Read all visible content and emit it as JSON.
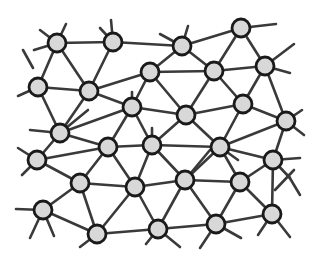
{
  "diagram": {
    "type": "network-graph",
    "colors": {
      "node_fill": "#d8d8d8",
      "node_stroke": "#1a1a1a",
      "edge": "#3a3a3a",
      "background": "#ffffff"
    },
    "node_radius": 9,
    "nodes": [
      {
        "id": 0,
        "x": 57,
        "y": 43
      },
      {
        "id": 1,
        "x": 113,
        "y": 42
      },
      {
        "id": 2,
        "x": 182,
        "y": 46
      },
      {
        "id": 3,
        "x": 241,
        "y": 28
      },
      {
        "id": 4,
        "x": 38,
        "y": 87
      },
      {
        "id": 5,
        "x": 89,
        "y": 91
      },
      {
        "id": 6,
        "x": 150,
        "y": 72
      },
      {
        "id": 7,
        "x": 214,
        "y": 71
      },
      {
        "id": 8,
        "x": 265,
        "y": 66
      },
      {
        "id": 9,
        "x": 60,
        "y": 133
      },
      {
        "id": 10,
        "x": 132,
        "y": 107
      },
      {
        "id": 11,
        "x": 186,
        "y": 115
      },
      {
        "id": 12,
        "x": 243,
        "y": 104
      },
      {
        "id": 13,
        "x": 286,
        "y": 121
      },
      {
        "id": 14,
        "x": 37,
        "y": 160
      },
      {
        "id": 15,
        "x": 108,
        "y": 147
      },
      {
        "id": 16,
        "x": 152,
        "y": 145
      },
      {
        "id": 17,
        "x": 220,
        "y": 147
      },
      {
        "id": 18,
        "x": 273,
        "y": 160
      },
      {
        "id": 19,
        "x": 80,
        "y": 183
      },
      {
        "id": 20,
        "x": 135,
        "y": 187
      },
      {
        "id": 21,
        "x": 185,
        "y": 180
      },
      {
        "id": 22,
        "x": 240,
        "y": 182
      },
      {
        "id": 23,
        "x": 43,
        "y": 210
      },
      {
        "id": 24,
        "x": 97,
        "y": 234
      },
      {
        "id": 25,
        "x": 158,
        "y": 229
      },
      {
        "id": 26,
        "x": 216,
        "y": 224
      },
      {
        "id": 27,
        "x": 272,
        "y": 214
      }
    ],
    "edges": [
      [
        0,
        1
      ],
      [
        0,
        4
      ],
      [
        0,
        5
      ],
      [
        1,
        2
      ],
      [
        1,
        5
      ],
      [
        2,
        3
      ],
      [
        2,
        6
      ],
      [
        2,
        7
      ],
      [
        3,
        7
      ],
      [
        3,
        8
      ],
      [
        4,
        5
      ],
      [
        4,
        9
      ],
      [
        5,
        6
      ],
      [
        5,
        9
      ],
      [
        5,
        10
      ],
      [
        6,
        7
      ],
      [
        6,
        10
      ],
      [
        6,
        11
      ],
      [
        7,
        8
      ],
      [
        7,
        11
      ],
      [
        7,
        12
      ],
      [
        8,
        12
      ],
      [
        8,
        13
      ],
      [
        9,
        10
      ],
      [
        9,
        14
      ],
      [
        9,
        15
      ],
      [
        10,
        11
      ],
      [
        10,
        15
      ],
      [
        10,
        16
      ],
      [
        11,
        12
      ],
      [
        11,
        16
      ],
      [
        11,
        17
      ],
      [
        12,
        13
      ],
      [
        12,
        17
      ],
      [
        13,
        17
      ],
      [
        13,
        18
      ],
      [
        14,
        19
      ],
      [
        14,
        15
      ],
      [
        15,
        16
      ],
      [
        15,
        19
      ],
      [
        15,
        20
      ],
      [
        16,
        17
      ],
      [
        16,
        20
      ],
      [
        16,
        21
      ],
      [
        17,
        21
      ],
      [
        17,
        22
      ],
      [
        17,
        18
      ],
      [
        18,
        22
      ],
      [
        18,
        27
      ],
      [
        19,
        20
      ],
      [
        19,
        23
      ],
      [
        19,
        24
      ],
      [
        20,
        21
      ],
      [
        20,
        24
      ],
      [
        20,
        25
      ],
      [
        21,
        22
      ],
      [
        21,
        25
      ],
      [
        21,
        26
      ],
      [
        22,
        26
      ],
      [
        22,
        27
      ],
      [
        23,
        24
      ],
      [
        24,
        25
      ],
      [
        25,
        26
      ],
      [
        26,
        27
      ]
    ],
    "stubs": [
      [
        57,
        43,
        40,
        30
      ],
      [
        57,
        43,
        66,
        24
      ],
      [
        57,
        43,
        34,
        50
      ],
      [
        113,
        42,
        111,
        20
      ],
      [
        113,
        42,
        100,
        28
      ],
      [
        23,
        50,
        33,
        68
      ],
      [
        38,
        87,
        18,
        96
      ],
      [
        182,
        46,
        160,
        34
      ],
      [
        182,
        46,
        188,
        26
      ],
      [
        241,
        28,
        276,
        24
      ],
      [
        265,
        66,
        294,
        44
      ],
      [
        265,
        66,
        290,
        73
      ],
      [
        286,
        121,
        302,
        110
      ],
      [
        286,
        121,
        304,
        135
      ],
      [
        273,
        160,
        300,
        158
      ],
      [
        273,
        160,
        290,
        178
      ],
      [
        37,
        160,
        18,
        148
      ],
      [
        37,
        160,
        22,
        175
      ],
      [
        43,
        210,
        16,
        209
      ],
      [
        43,
        210,
        30,
        238
      ],
      [
        43,
        210,
        54,
        236
      ],
      [
        97,
        234,
        80,
        247
      ],
      [
        158,
        229,
        146,
        244
      ],
      [
        158,
        229,
        180,
        247
      ],
      [
        216,
        224,
        200,
        248
      ],
      [
        216,
        224,
        241,
        238
      ],
      [
        272,
        214,
        258,
        235
      ],
      [
        272,
        214,
        290,
        237
      ],
      [
        60,
        133,
        30,
        130
      ],
      [
        60,
        133,
        88,
        110
      ],
      [
        152,
        145,
        152,
        128
      ],
      [
        132,
        107,
        132,
        92
      ],
      [
        220,
        147,
        238,
        160
      ],
      [
        185,
        180,
        210,
        150
      ],
      [
        294,
        170,
        275,
        190
      ],
      [
        288,
        175,
        300,
        195
      ]
    ]
  }
}
